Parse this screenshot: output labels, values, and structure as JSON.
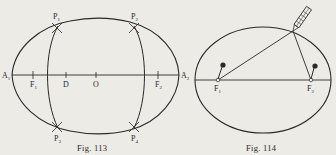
{
  "figures": [
    {
      "caption": "Fig. 113",
      "description": "Ellipse construction by intersecting arcs",
      "labels": {
        "A1": {
          "base": "A",
          "sub": "1"
        },
        "A2": {
          "base": "A",
          "sub": "2"
        },
        "F1": {
          "base": "F",
          "sub": "1"
        },
        "F2": {
          "base": "F",
          "sub": "2"
        },
        "D": {
          "base": "D",
          "sub": ""
        },
        "O": {
          "base": "O",
          "sub": ""
        },
        "P1": {
          "base": "P",
          "sub": "1"
        },
        "P2": {
          "base": "P",
          "sub": "2"
        },
        "P3": {
          "base": "P",
          "sub": "3"
        },
        "P4": {
          "base": "P",
          "sub": "4"
        }
      }
    },
    {
      "caption": "Fig. 114",
      "description": "Ellipse drawn with pins, string and pencil",
      "labels": {
        "F1": {
          "base": "F",
          "sub": "1"
        },
        "F2": {
          "base": "F",
          "sub": "2"
        }
      }
    }
  ],
  "colors": {
    "ink": "#2a2a2a",
    "paper": "#ecebe6"
  }
}
